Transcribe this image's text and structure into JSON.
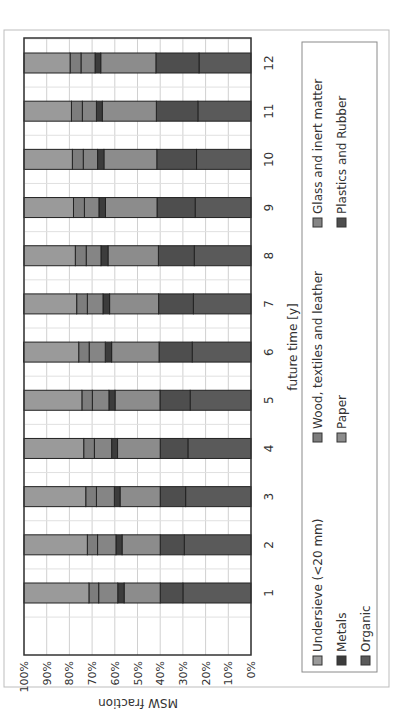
{
  "chart_data": {
    "type": "bar",
    "stacked": true,
    "percent_stacked": true,
    "orientation": "vertical-columns (image rotated 90° counter-clockwise)",
    "title": "",
    "xlabel": "future time [y]",
    "ylabel": "MSW fraction",
    "ylim": [
      0,
      100
    ],
    "y_ticks": [
      "0%",
      "10%",
      "20%",
      "30%",
      "40%",
      "50%",
      "60%",
      "70%",
      "80%",
      "90%",
      "100%"
    ],
    "grid": true,
    "legend_position": "bottom",
    "categories": [
      "1",
      "2",
      "3",
      "4",
      "5",
      "6",
      "7",
      "8",
      "9",
      "10",
      "11",
      "12"
    ],
    "series": [
      {
        "name": "Organic",
        "color": "#5a5a5a",
        "values": [
          30.0,
          29.4,
          28.8,
          27.8,
          26.8,
          25.9,
          25.4,
          25.0,
          24.6,
          24.0,
          23.4,
          22.9
        ]
      },
      {
        "name": "Plastics and Rubber",
        "color": "#4e4e4e",
        "values": [
          10.0,
          10.6,
          11.2,
          12.2,
          13.3,
          14.6,
          15.3,
          15.8,
          16.8,
          17.5,
          18.3,
          19.0
        ]
      },
      {
        "name": "Paper",
        "color": "#8c8c8c",
        "values": [
          15.9,
          16.8,
          17.7,
          18.8,
          19.8,
          20.9,
          21.6,
          22.2,
          22.7,
          23.3,
          23.8,
          24.3
        ]
      },
      {
        "name": "Metals",
        "color": "#3c3c3c",
        "values": [
          2.8,
          2.7,
          2.5,
          2.6,
          2.7,
          2.8,
          2.9,
          3.1,
          2.9,
          2.8,
          2.6,
          2.5
        ]
      },
      {
        "name": "Glass and inert matter",
        "color": "#858585",
        "values": [
          8.4,
          8.1,
          7.9,
          7.6,
          7.3,
          7.1,
          6.9,
          6.5,
          6.4,
          6.3,
          6.2,
          6.2
        ]
      },
      {
        "name": "Wood, textiles and leather",
        "color": "#7d7d7d",
        "values": [
          4.3,
          4.5,
          4.7,
          4.7,
          4.6,
          4.6,
          4.7,
          4.8,
          4.8,
          4.8,
          4.8,
          4.8
        ]
      },
      {
        "name": "Undersieve (<20 mm)",
        "color": "#9a9a9a",
        "values": [
          28.6,
          27.9,
          27.2,
          26.3,
          25.5,
          24.3,
          23.3,
          22.6,
          21.8,
          21.3,
          20.9,
          20.3
        ]
      }
    ]
  },
  "legend": [
    {
      "label": "Undersieve (<20 mm)",
      "series": 6
    },
    {
      "label": "Wood, textiles and leather",
      "series": 5
    },
    {
      "label": "Glass and inert matter",
      "series": 4
    },
    {
      "label": "Metals",
      "series": 3
    },
    {
      "label": "Paper",
      "series": 2
    },
    {
      "label": "Plastics and Rubber",
      "series": 1
    },
    {
      "label": "Organic",
      "series": 0
    }
  ]
}
